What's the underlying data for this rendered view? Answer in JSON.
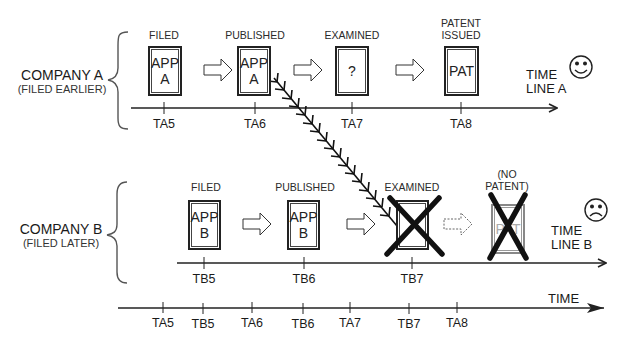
{
  "company_a": {
    "name": "COMPANY A",
    "note": "(FILED EARLIER)",
    "timeline_label_line1": "TIME",
    "timeline_label_line2": "LINE A",
    "face": "smiley-face",
    "stages": [
      {
        "label": "FILED",
        "doc_text_line1": "APP",
        "doc_text_line2": "A",
        "tick": "TA5"
      },
      {
        "label": "PUBLISHED",
        "doc_text_line1": "APP",
        "doc_text_line2": "A",
        "tick": "TA6"
      },
      {
        "label": "EXAMINED",
        "doc_text_line1": "?",
        "doc_text_line2": "",
        "tick": "TA7"
      },
      {
        "label_line1": "PATENT",
        "label_line2": "ISSUED",
        "doc_text_line1": "PAT",
        "doc_text_line2": "",
        "tick": "TA8"
      }
    ]
  },
  "company_b": {
    "name": "COMPANY B",
    "note": "(FILED LATER)",
    "timeline_label_line1": "TIME",
    "timeline_label_line2": "LINE B",
    "face": "frowning-face",
    "stages": [
      {
        "label": "FILED",
        "doc_text_line1": "APP",
        "doc_text_line2": "B",
        "tick": "TB5"
      },
      {
        "label": "PUBLISHED",
        "doc_text_line1": "APP",
        "doc_text_line2": "B",
        "tick": "TB6"
      },
      {
        "label": "EXAMINED",
        "doc_text_line1": "",
        "doc_text_line2": "",
        "tick": "TB7",
        "crossed_out": true
      },
      {
        "label_line1": "(NO",
        "label_line2": "PATENT)",
        "doc_text_line1": "PAT",
        "doc_text_line2": "",
        "tick": "",
        "crossed_out": true,
        "faded": true
      }
    ]
  },
  "combined_timeline": {
    "label": "TIME",
    "ticks": [
      "TA5",
      "TB5",
      "TA6",
      "TB6",
      "TA7",
      "TB7",
      "TA8"
    ]
  },
  "connector": {
    "type": "feathered-arrow",
    "from": "Company A published (TA6)",
    "to": "Company B examined (TB7)"
  }
}
